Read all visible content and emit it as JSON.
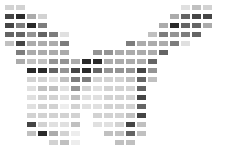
{
  "figure": {
    "background_color": "#ffffff",
    "canvas_width": 226,
    "canvas_height": 148
  },
  "grid": {
    "columns": 20,
    "rows": 16,
    "cell_width": 9,
    "cell_height": 5,
    "column_pitch": 11,
    "row_pitch": 9,
    "origin_x": 5,
    "origin_y": 5
  },
  "palette": {
    "0": "transparent",
    "1": "#ededed",
    "2": "#e0e0e0",
    "3": "#d2d2d2",
    "4": "#c0c0c0",
    "5": "#ababab",
    "6": "#949494",
    "7": "#7d7d7d",
    "8": "#646464",
    "9": "#454545",
    "10": "#2a2a2a"
  },
  "chart_data": {
    "type": "heatmap",
    "xlabel": "",
    "ylabel": "",
    "legend": [],
    "grid": false,
    "columns": 20,
    "rows": 16,
    "value_range": [
      0,
      10
    ],
    "values": [
      [
        3,
        3,
        0,
        0,
        0,
        0,
        0,
        0,
        0,
        0,
        0,
        0,
        0,
        0,
        0,
        0,
        2,
        4,
        3,
        0
      ],
      [
        9,
        10,
        5,
        3,
        0,
        0,
        0,
        0,
        0,
        0,
        0,
        0,
        0,
        0,
        0,
        5,
        8,
        9,
        9,
        0
      ],
      [
        9,
        7,
        10,
        7,
        0,
        0,
        0,
        0,
        0,
        0,
        0,
        0,
        0,
        0,
        5,
        10,
        8,
        8,
        5,
        0
      ],
      [
        8,
        8,
        6,
        8,
        7,
        2,
        0,
        0,
        0,
        0,
        0,
        0,
        0,
        4,
        7,
        6,
        7,
        8,
        0,
        0
      ],
      [
        4,
        9,
        5,
        5,
        5,
        7,
        0,
        0,
        0,
        0,
        0,
        7,
        5,
        5,
        5,
        7,
        2,
        0,
        0,
        0
      ],
      [
        0,
        7,
        5,
        5,
        5,
        5,
        0,
        0,
        6,
        6,
        5,
        5,
        5,
        5,
        8,
        0,
        0,
        0,
        0,
        0
      ],
      [
        0,
        5,
        4,
        4,
        6,
        6,
        5,
        10,
        10,
        5,
        5,
        5,
        5,
        8,
        0,
        0,
        0,
        0,
        0,
        0
      ],
      [
        0,
        0,
        10,
        10,
        8,
        6,
        9,
        10,
        8,
        6,
        6,
        6,
        9,
        6,
        0,
        0,
        0,
        0,
        0,
        0
      ],
      [
        0,
        0,
        3,
        3,
        2,
        4,
        7,
        7,
        3,
        3,
        3,
        4,
        8,
        4,
        0,
        0,
        0,
        0,
        0,
        0
      ],
      [
        0,
        0,
        2,
        4,
        4,
        2,
        6,
        3,
        2,
        3,
        3,
        3,
        8,
        0,
        0,
        0,
        0,
        0,
        0,
        0
      ],
      [
        0,
        0,
        2,
        3,
        3,
        2,
        4,
        2,
        2,
        3,
        3,
        3,
        9,
        0,
        0,
        0,
        0,
        0,
        0,
        0
      ],
      [
        0,
        0,
        2,
        3,
        3,
        1,
        3,
        2,
        2,
        3,
        3,
        3,
        8,
        0,
        0,
        0,
        0,
        0,
        0,
        0
      ],
      [
        0,
        0,
        3,
        3,
        3,
        3,
        3,
        0,
        3,
        3,
        3,
        4,
        9,
        0,
        0,
        0,
        0,
        0,
        0,
        0
      ],
      [
        0,
        0,
        9,
        3,
        2,
        2,
        4,
        0,
        2,
        2,
        3,
        9,
        4,
        0,
        0,
        0,
        0,
        0,
        0,
        0
      ],
      [
        0,
        0,
        4,
        10,
        5,
        3,
        1,
        0,
        0,
        4,
        4,
        8,
        4,
        0,
        0,
        0,
        0,
        0,
        0,
        0
      ],
      [
        0,
        0,
        0,
        0,
        3,
        4,
        1,
        0,
        0,
        0,
        4,
        4,
        0,
        0,
        0,
        0,
        0,
        0,
        0,
        0
      ]
    ]
  }
}
